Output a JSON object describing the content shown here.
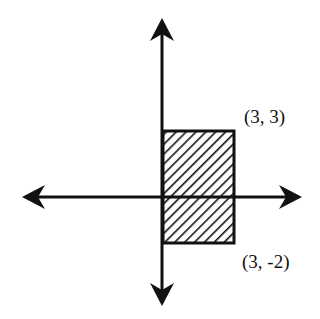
{
  "diagram": {
    "type": "coordinate-plane-region",
    "axes": {
      "x_axis": {
        "arrows": "both"
      },
      "y_axis": {
        "arrows": "both"
      }
    },
    "rectangle": {
      "fill": "diagonal-hatch",
      "vertices_labeled": [
        {
          "label": "(3, 3)",
          "x": 3,
          "y": 3
        },
        {
          "label": "(3, -2)",
          "x": 3,
          "y": -2
        }
      ]
    },
    "labels": {
      "top_right": "(3, 3)",
      "bottom_right": "(3, -2)"
    },
    "colors": {
      "stroke": "#111111",
      "background": "#ffffff"
    }
  }
}
